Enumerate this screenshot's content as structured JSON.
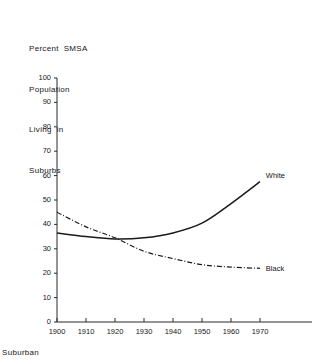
{
  "chart_data": {
    "type": "line",
    "title": "Percent SMSA Population Living in Suburbs",
    "title_lines": [
      "Percent  SMSA",
      "Population",
      "Living  in",
      "Suburbs"
    ],
    "xlabel": "",
    "ylabel": "",
    "x": [
      1900,
      1910,
      1920,
      1930,
      1940,
      1950,
      1960,
      1970
    ],
    "xlim": [
      1900,
      1975
    ],
    "ylim": [
      0,
      100
    ],
    "xticks": [
      "1900",
      "1910",
      "1920",
      "1930",
      "1940",
      "1950",
      "1960",
      "1970"
    ],
    "yticks": [
      "0",
      "10",
      "20",
      "30",
      "40",
      "50",
      "60",
      "70",
      "80",
      "90",
      "100"
    ],
    "grid": false,
    "legend_position": "inline-right",
    "series": [
      {
        "name": "White",
        "style": "solid",
        "values": [
          36.5,
          35.0,
          34.0,
          34.5,
          36.5,
          40.5,
          48.5,
          57.5
        ]
      },
      {
        "name": "Black",
        "style": "dash-dot",
        "values": [
          45.0,
          39.0,
          34.5,
          29.0,
          26.0,
          23.5,
          22.5,
          22.0
        ]
      }
    ],
    "annotations": [
      {
        "text": "White",
        "near_x": 1972,
        "near_y": 59
      },
      {
        "text": "Black",
        "near_x": 1972,
        "near_y": 21
      }
    ]
  },
  "footnote": {
    "text": "Suburban"
  }
}
